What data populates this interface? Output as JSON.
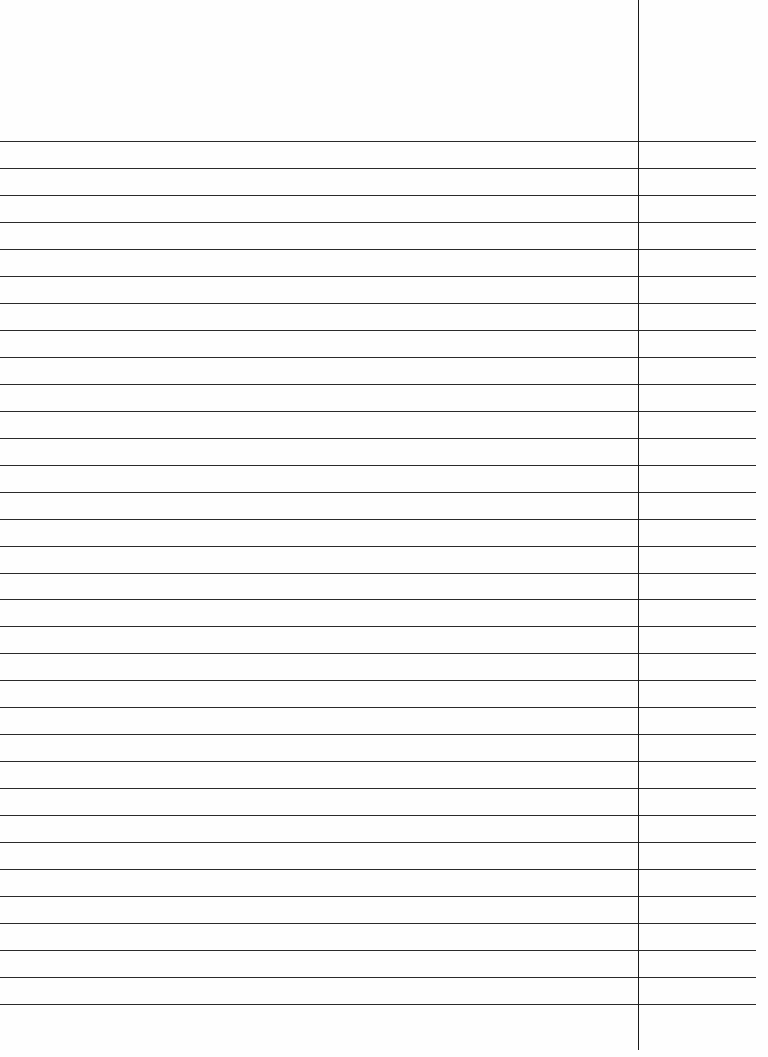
{
  "page": {
    "type": "ruled-notebook-sheet",
    "background_color": "#fefefe",
    "line_color": "#2a2a2a",
    "margin_line_color": "#1a1a1a",
    "rule_count": 33,
    "first_rule_y": 141,
    "rule_spacing": 26.97,
    "rule_width": 756,
    "margin_x": 638,
    "margin_height": 1050,
    "text_content": ""
  }
}
